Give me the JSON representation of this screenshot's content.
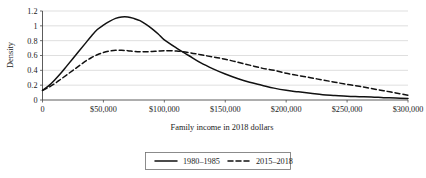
{
  "chart_data": {
    "type": "line",
    "title": "",
    "xlabel": "Family income in 2018 dollars",
    "ylabel": "Density",
    "xlim": [
      0,
      300000
    ],
    "ylim": [
      0,
      1.2
    ],
    "grid": true,
    "legend_position": "bottom",
    "x_tick_labels": [
      "0",
      "$50,000",
      "$100,000",
      "$150,000",
      "$200,000",
      "$250,000",
      "$300,000"
    ],
    "x_tick_values": [
      0,
      50000,
      100000,
      150000,
      200000,
      250000,
      300000
    ],
    "y_tick_labels": [
      "0",
      "0.2",
      "0.4",
      "0.6",
      "0.8",
      "1",
      "1.2"
    ],
    "y_tick_values": [
      0,
      0.2,
      0.4,
      0.6,
      0.8,
      1,
      1.2
    ],
    "x": [
      0,
      5000,
      10000,
      15000,
      20000,
      25000,
      30000,
      35000,
      40000,
      45000,
      50000,
      55000,
      60000,
      65000,
      70000,
      75000,
      80000,
      85000,
      90000,
      95000,
      100000,
      110000,
      120000,
      130000,
      140000,
      150000,
      160000,
      170000,
      180000,
      190000,
      200000,
      210000,
      220000,
      230000,
      240000,
      250000,
      260000,
      270000,
      280000,
      290000,
      300000
    ],
    "series": [
      {
        "name": "1980–1985",
        "style": "solid",
        "color": "#111111",
        "values": [
          0.13,
          0.19,
          0.27,
          0.36,
          0.46,
          0.56,
          0.66,
          0.76,
          0.86,
          0.95,
          1.01,
          1.06,
          1.1,
          1.12,
          1.12,
          1.1,
          1.07,
          1.02,
          0.96,
          0.89,
          0.81,
          0.7,
          0.6,
          0.5,
          0.42,
          0.35,
          0.29,
          0.24,
          0.2,
          0.16,
          0.13,
          0.11,
          0.09,
          0.07,
          0.06,
          0.05,
          0.045,
          0.04,
          0.032,
          0.026,
          0.02
        ]
      },
      {
        "name": "2015–2018",
        "style": "dashed",
        "color": "#111111",
        "values": [
          0.13,
          0.17,
          0.22,
          0.28,
          0.34,
          0.4,
          0.46,
          0.52,
          0.57,
          0.61,
          0.64,
          0.66,
          0.67,
          0.67,
          0.665,
          0.655,
          0.65,
          0.65,
          0.655,
          0.66,
          0.665,
          0.66,
          0.64,
          0.61,
          0.58,
          0.55,
          0.51,
          0.47,
          0.43,
          0.4,
          0.36,
          0.33,
          0.3,
          0.27,
          0.24,
          0.21,
          0.185,
          0.155,
          0.125,
          0.095,
          0.065
        ]
      }
    ]
  },
  "legend": {
    "items": [
      {
        "label": "1980–1985",
        "style": "solid"
      },
      {
        "label": "2015–2018",
        "style": "dashed"
      }
    ]
  }
}
